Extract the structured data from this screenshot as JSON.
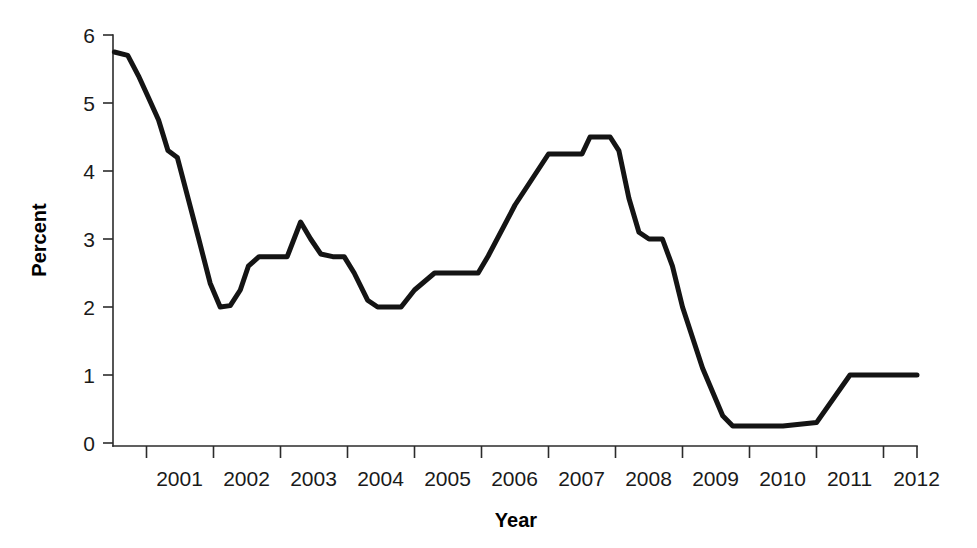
{
  "chart_data": {
    "type": "line",
    "title": "",
    "xlabel": "Year",
    "ylabel": "Percent",
    "xlim": [
      2000.5,
      2012.5
    ],
    "ylim": [
      0,
      6
    ],
    "grid": false,
    "legend": null,
    "x_tick_labels": [
      "2001",
      "2002",
      "2003",
      "2004",
      "2005",
      "2006",
      "2007",
      "2008",
      "2009",
      "2010",
      "2011",
      "2012"
    ],
    "x_tick_values": [
      2001,
      2002,
      2003,
      2004,
      2005,
      2006,
      2007,
      2008,
      2009,
      2010,
      2011,
      2012
    ],
    "y_tick_labels": [
      "0",
      "1",
      "2",
      "3",
      "4",
      "5",
      "6"
    ],
    "y_tick_values": [
      0,
      1,
      2,
      3,
      4,
      5,
      6
    ],
    "series": [
      {
        "name": "Percent",
        "color": "#141414",
        "x": [
          2000.52,
          2000.72,
          2000.88,
          2001.02,
          2001.18,
          2001.32,
          2001.46,
          2001.62,
          2001.78,
          2001.95,
          2002.1,
          2002.25,
          2002.4,
          2002.52,
          2002.68,
          2002.9,
          2003.1,
          2003.3,
          2003.45,
          2003.6,
          2003.78,
          2003.95,
          2004.1,
          2004.3,
          2004.45,
          2004.6,
          2004.8,
          2005.0,
          2005.3,
          2005.55,
          2005.75,
          2005.95,
          2006.1,
          2006.5,
          2007.0,
          2007.12,
          2007.25,
          2007.5,
          2007.62,
          2007.78,
          2007.92,
          2008.05,
          2008.2,
          2008.35,
          2008.5,
          2008.7,
          2008.85,
          2009.0,
          2009.3,
          2009.6,
          2009.75,
          2009.88,
          2010.05,
          2010.2,
          2010.5,
          2011.0,
          2011.5,
          2012.0,
          2012.5
        ],
        "y": [
          5.75,
          5.7,
          5.4,
          5.1,
          4.75,
          4.3,
          4.2,
          3.6,
          3.0,
          2.35,
          2.0,
          2.02,
          2.25,
          2.6,
          2.74,
          2.74,
          2.74,
          3.25,
          3.0,
          2.78,
          2.74,
          2.74,
          2.5,
          2.1,
          2.0,
          2.0,
          2.0,
          2.25,
          2.5,
          2.5,
          2.5,
          2.5,
          2.75,
          3.5,
          4.25,
          4.25,
          4.25,
          4.25,
          4.5,
          4.5,
          4.5,
          4.3,
          3.6,
          3.1,
          3.0,
          3.0,
          2.6,
          2.0,
          1.1,
          0.4,
          0.25,
          0.25,
          0.25,
          0.25,
          0.25,
          0.3,
          1.0,
          1.0,
          1.0
        ]
      }
    ]
  },
  "axes": {
    "y_axis_title": "Percent",
    "x_axis_title": "Year"
  }
}
